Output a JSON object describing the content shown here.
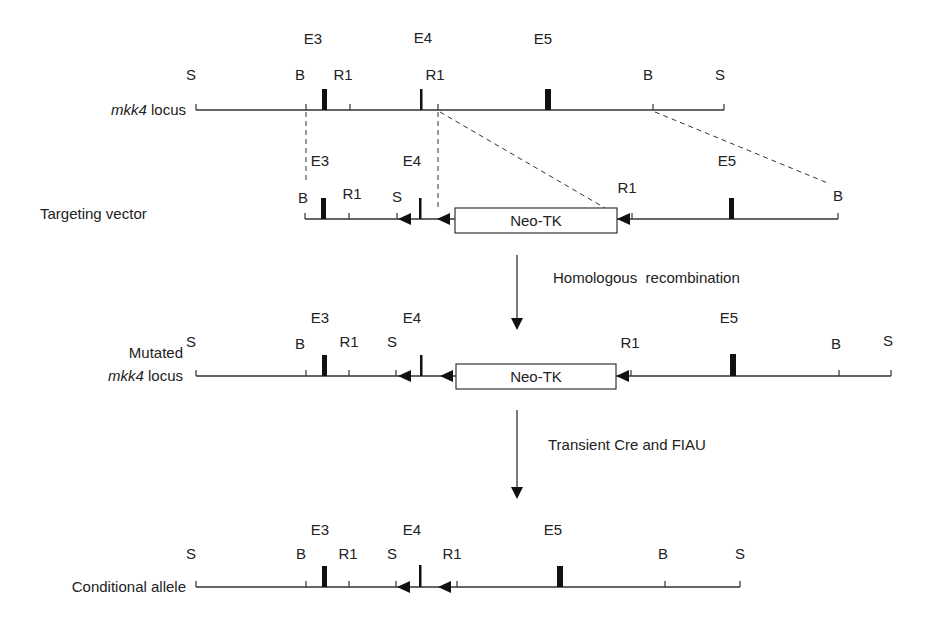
{
  "rows": {
    "wt": {
      "label_italic": "mkk4",
      "label_rest": " locus",
      "sites": {
        "s1": "S",
        "b1": "B",
        "r1a": "R1",
        "r1b": "R1",
        "b2": "B",
        "s2": "S"
      },
      "exons": {
        "e3": "E3",
        "e4": "E4",
        "e5": "E5"
      }
    },
    "vector": {
      "label": "Targeting vector",
      "sites": {
        "b1": "B",
        "r1a": "R1",
        "s1": "S",
        "r1b": "R1",
        "b2": "B"
      },
      "exons": {
        "e3": "E3",
        "e4": "E4",
        "e5": "E5"
      },
      "cassette": "Neo-TK"
    },
    "mutated": {
      "label_line1": "Mutated",
      "label_italic": "mkk4",
      "label_rest": " locus",
      "sites": {
        "s1": "S",
        "b1": "B",
        "r1a": "R1",
        "s2": "S",
        "r1b": "R1",
        "b2": "B",
        "s3": "S"
      },
      "exons": {
        "e3": "E3",
        "e4": "E4",
        "e5": "E5"
      },
      "cassette": "Neo-TK"
    },
    "conditional": {
      "label": "Conditional allele",
      "sites": {
        "s1": "S",
        "b1": "B",
        "r1a": "R1",
        "s2": "S",
        "r1b": "R1",
        "b2": "B",
        "s3": "S"
      },
      "exons": {
        "e3": "E3",
        "e4": "E4",
        "e5": "E5"
      }
    }
  },
  "steps": {
    "step1": "Homologous  recombination",
    "step2": "Transient Cre and FIAU"
  }
}
